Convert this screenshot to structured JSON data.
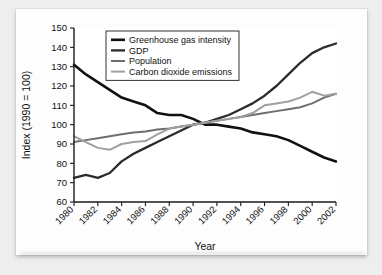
{
  "chart_data": {
    "type": "line",
    "title": "",
    "xlabel": "Year",
    "ylabel": "Index (1990 = 100)",
    "xlim": [
      1980,
      2002
    ],
    "ylim": [
      60,
      150
    ],
    "yticks": [
      60,
      70,
      80,
      90,
      100,
      110,
      120,
      130,
      140,
      150
    ],
    "xticks": [
      1980,
      1982,
      1984,
      1986,
      1988,
      1990,
      1992,
      1994,
      1996,
      1998,
      2000,
      2002
    ],
    "xtick_labels": [
      "1980",
      "1982",
      "1984",
      "1986",
      "1988",
      "1990",
      "1992",
      "1994",
      "1996",
      "1998",
      "2000",
      "2002"
    ],
    "ytick_labels": [
      "60",
      "70",
      "80",
      "90",
      "100",
      "110",
      "120",
      "130",
      "140",
      "150"
    ],
    "grid": false,
    "legend_position": "top-center",
    "x": [
      1980,
      1981,
      1982,
      1983,
      1984,
      1985,
      1986,
      1987,
      1988,
      1989,
      1990,
      1991,
      1992,
      1993,
      1994,
      1995,
      1996,
      1997,
      1998,
      1999,
      2000,
      2001,
      2002
    ],
    "series": [
      {
        "name": "Greenhouse gas intensity",
        "color": "#111111",
        "width": 2.6,
        "values": [
          131,
          126,
          122,
          118,
          114,
          112,
          110,
          106,
          105,
          105,
          103,
          100,
          100,
          99,
          98,
          96,
          95,
          94,
          92,
          89,
          86,
          83,
          81
        ]
      },
      {
        "name": "GDP",
        "color": "#2b2b2b",
        "width": 2.3,
        "values": [
          72.5,
          74,
          72.5,
          75,
          81,
          85,
          88,
          91,
          94,
          97,
          100,
          101,
          103,
          105,
          108,
          111,
          115,
          120,
          126,
          132,
          137,
          140,
          142
        ]
      },
      {
        "name": "Population",
        "color": "#6e6e6e",
        "width": 2.0,
        "values": [
          91,
          92,
          93,
          94,
          95,
          96,
          96.5,
          97.5,
          98,
          99,
          100,
          101,
          102,
          103,
          104,
          105,
          106,
          107,
          108,
          109,
          111,
          114,
          116
        ]
      },
      {
        "name": "Carbon dioxide emissions",
        "color": "#a0a0a0",
        "width": 2.0,
        "values": [
          94,
          91,
          88,
          87,
          90,
          91,
          91.5,
          95,
          98,
          99,
          100,
          101,
          102,
          103,
          104,
          106,
          110,
          111,
          112,
          114,
          117,
          115,
          116
        ]
      }
    ]
  },
  "legend": {
    "items": [
      {
        "label": "Greenhouse gas intensity"
      },
      {
        "label": "GDP"
      },
      {
        "label": "Population"
      },
      {
        "label": "Carbon dioxide emissions"
      }
    ]
  }
}
